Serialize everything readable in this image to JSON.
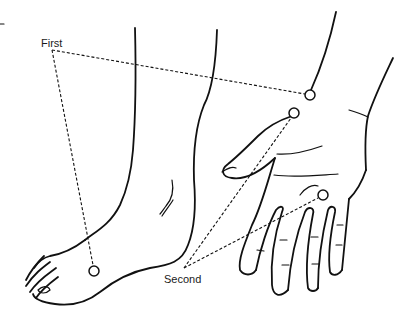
{
  "figure": {
    "labels": {
      "first": "First",
      "second": "Second"
    },
    "points": [
      {
        "id": "first-wrist-upper",
        "group": "First",
        "x": 310,
        "y": 95
      },
      {
        "id": "second-wrist-lower",
        "group": "Second",
        "x": 294,
        "y": 113
      },
      {
        "id": "second-palm",
        "group": "Second",
        "x": 323,
        "y": 195
      },
      {
        "id": "first-foot",
        "group": "First",
        "x": 94,
        "y": 271
      }
    ],
    "colors": {
      "line": "#111111",
      "background": "#ffffff"
    }
  }
}
